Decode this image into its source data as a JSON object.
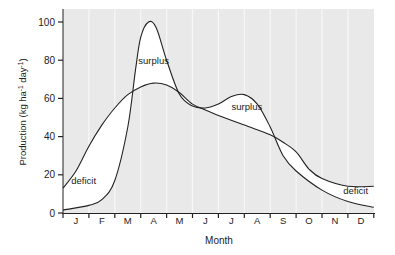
{
  "chart_data": {
    "type": "line",
    "title": "",
    "xlabel": "Month",
    "ylabel": "Production (kg ha⁻¹ day⁻¹)",
    "ylim": [
      0,
      105
    ],
    "yticks": [
      0,
      20,
      40,
      60,
      80,
      100
    ],
    "categories": [
      "J",
      "F",
      "M",
      "A",
      "M",
      "J",
      "J",
      "A",
      "S",
      "O",
      "N",
      "D"
    ],
    "grid": "vertical month boundaries (white lines on grey background)",
    "x_units": "months elapsed from start of January (0-12)",
    "series": [
      {
        "name": "Peaked production curve",
        "x": [
          0,
          1,
          1.5,
          2,
          2.5,
          2.8,
          3,
          3.3,
          3.6,
          4,
          4.5,
          5,
          5.5,
          6,
          6.5,
          7,
          7.5,
          8,
          8.5,
          9,
          10,
          11,
          12
        ],
        "values": [
          1.5,
          4,
          7,
          17,
          45,
          75,
          92,
          100,
          97,
          80,
          62,
          56,
          55,
          57,
          61,
          62,
          57,
          45,
          30,
          22,
          12,
          6,
          3
        ]
      },
      {
        "name": "Broad curve",
        "x": [
          0,
          0.5,
          1,
          1.5,
          2,
          2.5,
          3,
          3.5,
          4,
          4.5,
          5,
          5.5,
          6,
          7,
          8,
          8.5,
          9,
          9.5,
          10,
          11,
          12
        ],
        "values": [
          13,
          22,
          35,
          46,
          55,
          62,
          66,
          68,
          67,
          63,
          57,
          54,
          51,
          46,
          41,
          37,
          32,
          23,
          18,
          14,
          14
        ]
      }
    ],
    "annotations": [
      {
        "text": "surplus",
        "x": 3.5,
        "y": 78
      },
      {
        "text": "surplus",
        "x": 7.1,
        "y": 54
      },
      {
        "text": "deficit",
        "x": 0.8,
        "y": 15
      },
      {
        "text": "deficit",
        "x": 11.3,
        "y": 10
      }
    ]
  },
  "labels": {
    "xlabel": "Month",
    "ylabel_main": "Production (kg ha",
    "ylabel_sup1": "-1",
    "ylabel_mid": " day",
    "ylabel_sup2": "-1",
    "ylabel_end": ")"
  },
  "colors": {
    "plot_background": "#e9e9e9",
    "between_curves": "#ffffff",
    "line": "#222222",
    "grid": "#f7f7f7"
  }
}
